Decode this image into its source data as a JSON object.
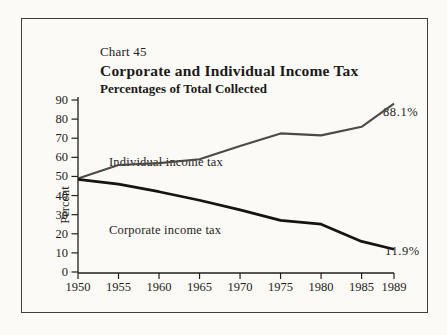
{
  "chart": {
    "number_label": "Chart 45",
    "title": "Corporate and Individual Income Tax",
    "subtitle": "Percentages of Total Collected",
    "ylabel": "Percent",
    "individual_series_label": "Individual income tax",
    "corporate_series_label": "Corporate income tax",
    "individual_end_label": "88.1%",
    "corporate_end_label": "11.9%"
  },
  "chart_data": {
    "type": "line",
    "title": "Corporate and Individual Income Tax",
    "subtitle": "Percentages of Total Collected",
    "xlabel": "",
    "ylabel": "Percent",
    "x": [
      1950,
      1955,
      1960,
      1965,
      1970,
      1975,
      1980,
      1985,
      1989
    ],
    "xtick_labels": [
      "1950",
      "1955",
      "1960",
      "1965",
      "1970",
      "1975",
      "1980",
      "1985",
      "1989"
    ],
    "series": [
      {
        "name": "Individual income tax",
        "values": [
          49,
          56,
          57,
          59,
          66,
          72.5,
          71.5,
          76,
          88.1
        ],
        "color": "#4b4a47",
        "stroke_width": 2.1,
        "end_annotation": "88.1%"
      },
      {
        "name": "Corporate income tax",
        "values": [
          48.5,
          46,
          42,
          37.5,
          32.5,
          27,
          25,
          16,
          11.9
        ],
        "color": "#151411",
        "stroke_width": 2.7,
        "end_annotation": "11.9%"
      }
    ],
    "ylim": [
      0,
      90
    ],
    "yticks": [
      0,
      10,
      20,
      30,
      40,
      50,
      60,
      70,
      80,
      90
    ],
    "ytick_labels": [
      "0",
      "10",
      "20",
      "30",
      "40",
      "50",
      "60",
      "70",
      "80",
      "90"
    ],
    "grid": false,
    "legend_position": "inline-labels",
    "axis_color": "#21201d",
    "tick_label_color": "#242320"
  }
}
